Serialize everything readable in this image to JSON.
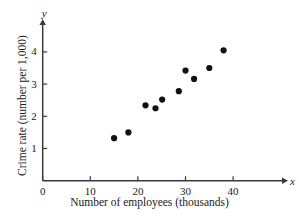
{
  "chart_data": {
    "type": "scatter",
    "title": "",
    "xlabel": "Number of employees (thousands)",
    "ylabel": "Crime rate (number per 1,000)",
    "x_axis_variable": "x",
    "y_axis_variable": "y",
    "xlim": [
      0,
      50
    ],
    "ylim": [
      0,
      4.8
    ],
    "xticks": [
      0,
      10,
      20,
      30,
      40
    ],
    "xtick_labels": [
      "0",
      "10",
      "20",
      "30",
      "40"
    ],
    "yticks": [
      1,
      2,
      3,
      4
    ],
    "ytick_labels": [
      "1",
      "2",
      "3",
      "4"
    ],
    "grid": false,
    "legend": false,
    "marker": "filled-circle",
    "marker_color": "#111111",
    "axis_color": "#3a3a3a",
    "points": [
      {
        "x": 15.0,
        "y": 1.32
      },
      {
        "x": 18.0,
        "y": 1.5
      },
      {
        "x": 21.6,
        "y": 2.34
      },
      {
        "x": 23.7,
        "y": 2.25
      },
      {
        "x": 25.1,
        "y": 2.52
      },
      {
        "x": 28.6,
        "y": 2.78
      },
      {
        "x": 30.0,
        "y": 3.42
      },
      {
        "x": 31.8,
        "y": 3.16
      },
      {
        "x": 35.0,
        "y": 3.5
      },
      {
        "x": 38.0,
        "y": 4.05
      }
    ]
  }
}
